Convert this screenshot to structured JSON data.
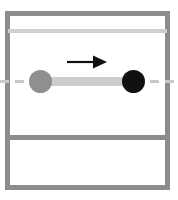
{
  "figure": {
    "width": 178,
    "height": 200,
    "background_color": "#ffffff"
  },
  "colors": {
    "frame_gray": "#8c8c8c",
    "light_rule_gray": "#cfcfcf",
    "centerline_gray": "#c8c8c8",
    "connector_gray": "#cdcdcd",
    "mass_left_gray": "#8f8f8f",
    "mass_right_black": "#111111",
    "arrow_black": "#111111"
  },
  "frame": {
    "top_bar_label": "",
    "bottom_bar_label": "",
    "left_bar_label": "",
    "right_bar_label": ""
  },
  "rules": {
    "upper_rule_label": "",
    "lower_divider_label": "",
    "centerline_label": ""
  },
  "objects": {
    "left_mass": {
      "label": "",
      "fill": "#8f8f8f",
      "center_x": 40,
      "center_y": 81,
      "radius": 11
    },
    "right_mass": {
      "label": "",
      "fill": "#111111",
      "center_x": 133,
      "center_y": 81,
      "radius": 11
    },
    "connector": {
      "label": "",
      "fill": "#cdcdcd",
      "x1": 40,
      "x2": 134,
      "y": 81
    },
    "arrow": {
      "label": "",
      "direction": "right",
      "x1": 68,
      "x2": 106,
      "y": 62
    }
  }
}
